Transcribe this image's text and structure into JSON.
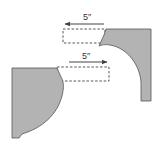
{
  "diagram": {
    "type": "shift-illustration",
    "colors": {
      "fill": "#b3b3b3",
      "stroke": "#555555",
      "dash": "#444444",
      "arrow": "#444444",
      "text": "#333333"
    },
    "top": {
      "label": "5″",
      "arrow_direction": "left",
      "arrow": {
        "x1": 104,
        "y1": 24,
        "x2": 65,
        "y2": 24
      },
      "dashed_rect": {
        "x": 63,
        "y": 29,
        "w": 42,
        "h": 14
      },
      "shape": "right-arch-piece"
    },
    "bottom": {
      "label": "5″",
      "arrow_direction": "right",
      "arrow": {
        "x1": 69,
        "y1": 62,
        "x2": 107,
        "y2": 62
      },
      "dashed_rect": {
        "x": 57,
        "y": 67,
        "w": 52,
        "h": 14
      },
      "shape": "left-bulge-piece"
    }
  }
}
